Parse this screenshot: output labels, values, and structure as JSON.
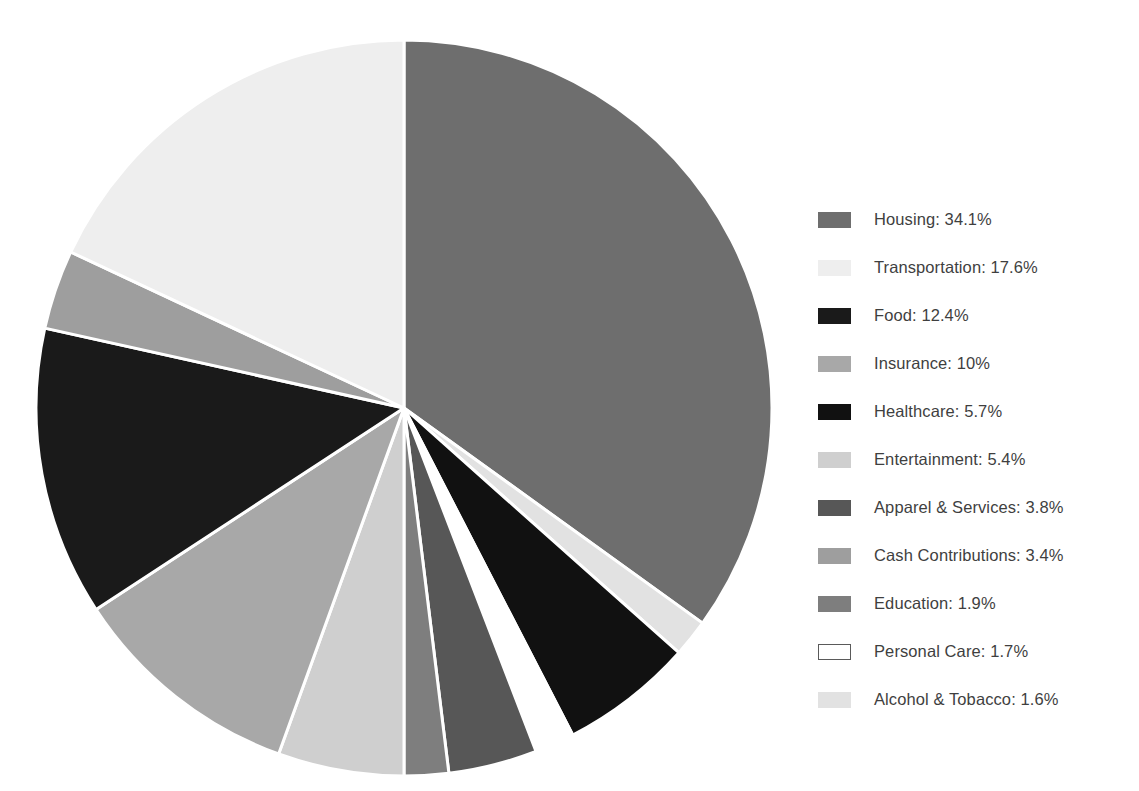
{
  "chart_data": {
    "type": "pie",
    "title": "",
    "subtitle": "",
    "xlabel": "",
    "ylabel": "",
    "legend_position": "right",
    "grid": false,
    "start_angle_deg": 0,
    "direction": "clockwise",
    "total_percent": 97.6,
    "units": "percent",
    "categories": [
      "Housing",
      "Transportation",
      "Food",
      "Insurance",
      "Healthcare",
      "Entertainment",
      "Apparel & Services",
      "Cash Contributions",
      "Education",
      "Personal Care",
      "Alcohol & Tobacco"
    ],
    "values": [
      34.1,
      17.6,
      12.4,
      10,
      5.7,
      5.4,
      3.8,
      3.4,
      1.9,
      1.7,
      1.6
    ],
    "value_labels": [
      "34.1%",
      "17.6%",
      "12.4%",
      "10%",
      "5.7%",
      "5.4%",
      "3.8%",
      "3.4%",
      "1.9%",
      "1.7%",
      "1.6%"
    ],
    "colors": [
      "#6e6e6e",
      "#eeeeee",
      "#1a1a1a",
      "#a8a8a8",
      "#111111",
      "#cfcfcf",
      "#575757",
      "#9e9e9e",
      "#7e7e7e",
      "#ffffff",
      "#e2e2e2"
    ],
    "slice_order_clockwise": [
      "Housing",
      "Alcohol & Tobacco",
      "Healthcare",
      "Personal Care",
      "Apparel & Services",
      "Education",
      "Entertainment",
      "Insurance",
      "Food",
      "Cash Contributions",
      "Transportation"
    ]
  },
  "legend": {
    "items": [
      {
        "label": "Housing: 34.1%",
        "name": "Housing",
        "value": "34.1%",
        "color": "#6e6e6e",
        "outline": false
      },
      {
        "label": "Transportation: 17.6%",
        "name": "Transportation",
        "value": "17.6%",
        "color": "#eeeeee",
        "outline": false
      },
      {
        "label": "Food: 12.4%",
        "name": "Food",
        "value": "12.4%",
        "color": "#1a1a1a",
        "outline": false
      },
      {
        "label": "Insurance: 10%",
        "name": "Insurance",
        "value": "10%",
        "color": "#a8a8a8",
        "outline": false
      },
      {
        "label": "Healthcare: 5.7%",
        "name": "Healthcare",
        "value": "5.7%",
        "color": "#111111",
        "outline": false
      },
      {
        "label": "Entertainment: 5.4%",
        "name": "Entertainment",
        "value": "5.4%",
        "color": "#cfcfcf",
        "outline": false
      },
      {
        "label": "Apparel & Services: 3.8%",
        "name": "Apparel & Services",
        "value": "3.8%",
        "color": "#575757",
        "outline": false
      },
      {
        "label": "Cash Contributions: 3.4%",
        "name": "Cash Contributions",
        "value": "3.4%",
        "color": "#9e9e9e",
        "outline": false
      },
      {
        "label": "Education: 1.9%",
        "name": "Education",
        "value": "1.9%",
        "color": "#7e7e7e",
        "outline": false
      },
      {
        "label": "Personal Care: 1.7%",
        "name": "Personal Care",
        "value": "1.7%",
        "color": "#ffffff",
        "outline": true
      },
      {
        "label": "Alcohol & Tobacco: 1.6%",
        "name": "Alcohol & Tobacco",
        "value": "1.6%",
        "color": "#e2e2e2",
        "outline": false
      }
    ]
  },
  "pie_geometry": {
    "center_x": 404,
    "center_y": 408,
    "radius": 368,
    "gap_color": "#ffffff",
    "gap_width_px": 3
  }
}
